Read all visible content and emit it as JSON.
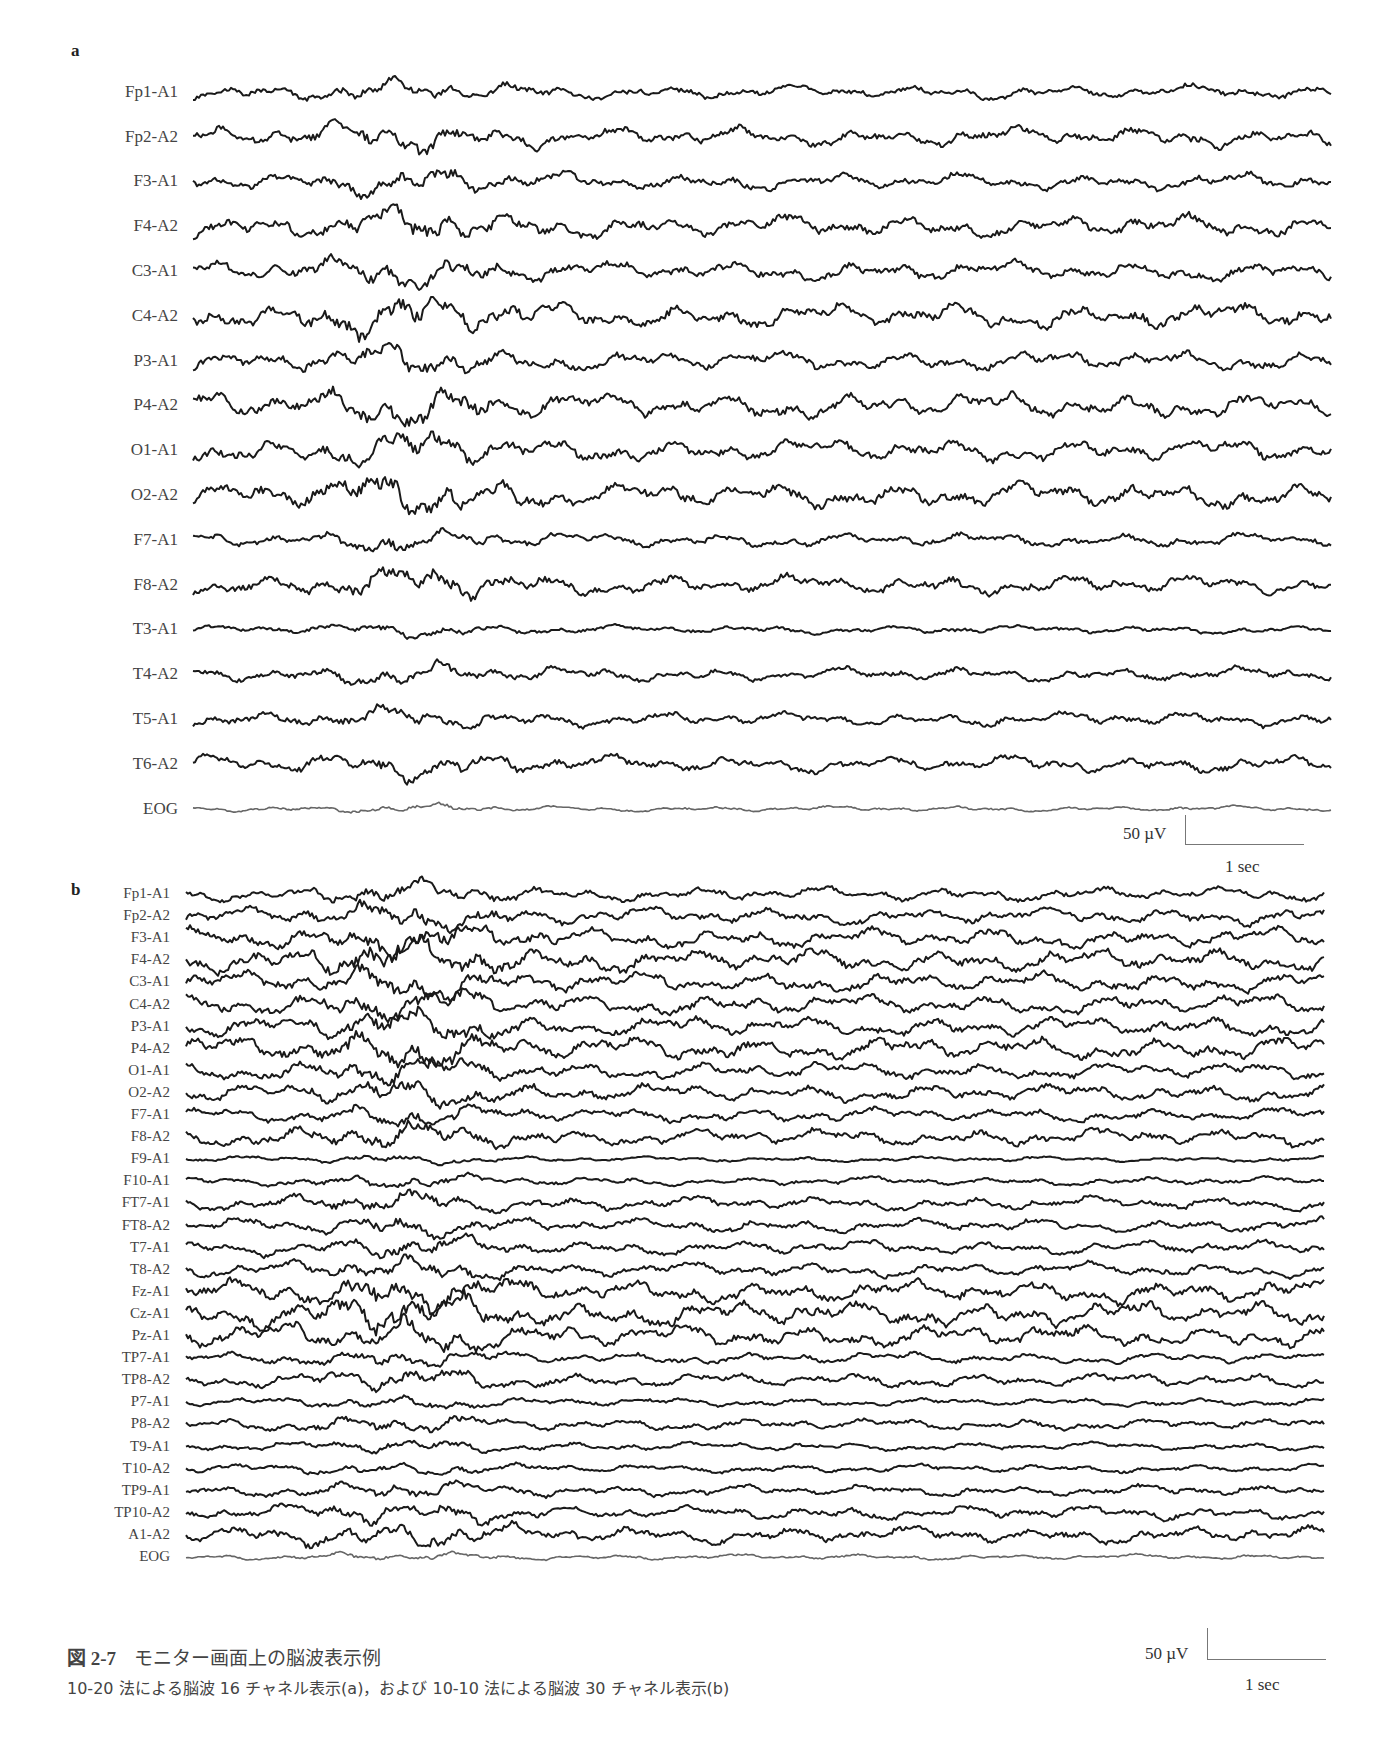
{
  "figure": {
    "number": "図 2-7",
    "title": "モニター画面上の脳波表示例",
    "subtitle": "10-20 法による脳波 16 チャネル表示(a)，および 10-10 法による脳波 30 チャネル表示(b)"
  },
  "chart_data": [
    {
      "type": "line",
      "panel": "a",
      "title": "10-20 法による脳波 16 チャネル表示",
      "channels": [
        "Fp1-A1",
        "Fp2-A2",
        "F3-A1",
        "F4-A2",
        "C3-A1",
        "C4-A2",
        "P3-A1",
        "P4-A2",
        "O1-A1",
        "O2-A2",
        "F7-A1",
        "F8-A2",
        "T3-A1",
        "T4-A2",
        "T5-A1",
        "T6-A2",
        "EOG"
      ],
      "channel_amplitude_px": [
        5,
        7,
        6,
        8,
        7,
        9,
        7,
        9,
        8,
        9,
        5,
        7,
        3,
        5,
        5,
        6,
        2
      ],
      "trace_color": "#1a1a1a",
      "grid": false,
      "scale": {
        "amplitude_label": "50 µV",
        "time_label": "1 sec"
      },
      "layout": {
        "label_right_x": 178,
        "trace_x0": 193,
        "trace_x1": 1332,
        "first_y": 92,
        "row_spacing": 44.8
      }
    },
    {
      "type": "line",
      "panel": "b",
      "title": "10-10 法による脳波 30 チャネル表示",
      "channels": [
        "Fp1-A1",
        "Fp2-A2",
        "F3-A1",
        "F4-A2",
        "C3-A1",
        "C4-A2",
        "P3-A1",
        "P4-A2",
        "O1-A1",
        "O2-A2",
        "F7-A1",
        "F8-A2",
        "F9-A1",
        "F10-A1",
        "FT7-A1",
        "FT8-A2",
        "T7-A1",
        "T8-A2",
        "Fz-A1",
        "Cz-A1",
        "Pz-A1",
        "TP7-A1",
        "TP8-A2",
        "P7-A1",
        "P8-A2",
        "T9-A1",
        "T10-A2",
        "TP9-A1",
        "TP10-A2",
        "A1-A2",
        "EOG"
      ],
      "channel_amplitude_px": [
        5,
        6,
        7,
        8,
        7,
        7,
        7,
        8,
        6,
        6,
        5,
        6,
        2,
        3,
        5,
        5,
        5,
        5,
        8,
        9,
        8,
        4,
        5,
        3,
        4,
        3,
        3,
        4,
        5,
        6,
        2
      ],
      "trace_color": "#1a1a1a",
      "grid": false,
      "scale": {
        "amplitude_label": "50 µV",
        "time_label": "1 sec"
      },
      "layout": {
        "label_right_x": 170,
        "trace_x0": 186,
        "trace_x1": 1325,
        "first_y": 894,
        "row_spacing": 22.1
      }
    }
  ],
  "panels": {
    "a": {
      "letter": "a"
    },
    "b": {
      "letter": "b"
    }
  },
  "scale_bars": {
    "a": {
      "amplitude": "50 µV",
      "time": "1 sec"
    },
    "b": {
      "amplitude": "50 µV",
      "time": "1 sec"
    }
  }
}
